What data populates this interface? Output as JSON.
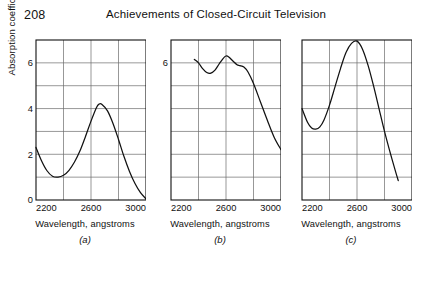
{
  "header": {
    "page_number": "208",
    "title": "Achievements of Closed-Circuit Television"
  },
  "figure": {
    "y_axis_title": "Absorption coefficient, relative units",
    "x_axis_title": "Wavelength, angstroms"
  },
  "chart_data": [
    {
      "type": "line",
      "panel_label": "(a)",
      "title": "",
      "xlabel": "Wavelength, angstroms",
      "ylabel": "Absorption coefficient, relative units",
      "xlim": [
        2200,
        3000
      ],
      "ylim": [
        0,
        7
      ],
      "xticks": [
        2200,
        2600,
        3000
      ],
      "xticklabels": [
        "2200",
        "2600",
        "3000"
      ],
      "yticks": [
        0,
        2,
        4,
        6
      ],
      "yticklabels": [
        "0",
        "2",
        "4",
        "6"
      ],
      "grid": true,
      "x_gridlines": [
        2200,
        2400,
        2600,
        2800,
        3000
      ],
      "y_gridlines": [
        0,
        1,
        2,
        3,
        4,
        5,
        6,
        7
      ],
      "x": [
        2200,
        2240,
        2280,
        2320,
        2360,
        2400,
        2440,
        2480,
        2520,
        2560,
        2600,
        2640,
        2660,
        2680,
        2720,
        2760,
        2800,
        2840,
        2880,
        2920,
        2960,
        3000
      ],
      "values": [
        2.3,
        1.72,
        1.28,
        1.04,
        1.0,
        1.08,
        1.3,
        1.66,
        2.15,
        2.78,
        3.45,
        4.05,
        4.2,
        4.18,
        3.9,
        3.35,
        2.65,
        1.9,
        1.25,
        0.72,
        0.32,
        0.05
      ]
    },
    {
      "type": "line",
      "panel_label": "(b)",
      "title": "",
      "xlabel": "Wavelength, angstroms",
      "ylabel": "Absorption coefficient, relative units",
      "xlim": [
        2200,
        3000
      ],
      "ylim": [
        0,
        7
      ],
      "xticks": [
        2200,
        2600,
        3000
      ],
      "xticklabels": [
        "2200",
        "2600",
        "3000"
      ],
      "yticks": [
        6
      ],
      "yticklabels": [
        "6"
      ],
      "grid": true,
      "x_gridlines": [
        2200,
        2400,
        2600,
        2800,
        3000
      ],
      "y_gridlines": [
        0,
        1,
        2,
        3,
        4,
        5,
        6,
        7
      ],
      "x": [
        2370,
        2400,
        2430,
        2460,
        2490,
        2520,
        2550,
        2580,
        2600,
        2620,
        2650,
        2680,
        2700,
        2730,
        2760,
        2800,
        2850,
        2900,
        2950,
        3000
      ],
      "values": [
        6.15,
        6.0,
        5.75,
        5.58,
        5.55,
        5.68,
        5.95,
        6.2,
        6.3,
        6.26,
        6.08,
        5.92,
        5.88,
        5.82,
        5.6,
        5.1,
        4.3,
        3.5,
        2.75,
        2.2
      ]
    },
    {
      "type": "line",
      "panel_label": "(c)",
      "title": "",
      "xlabel": "Wavelength, angstroms",
      "ylabel": "Absorption coefficient, relative units",
      "xlim": [
        2200,
        3000
      ],
      "ylim": [
        0,
        7
      ],
      "xticks": [
        2200,
        2600,
        3000
      ],
      "xticklabels": [
        "2200",
        "2600",
        "3000"
      ],
      "yticks": [],
      "yticklabels": [],
      "grid": true,
      "x_gridlines": [
        2200,
        2400,
        2600,
        2800,
        3000
      ],
      "y_gridlines": [
        0,
        1,
        2,
        3,
        4,
        5,
        6,
        7
      ],
      "x": [
        2200,
        2240,
        2270,
        2300,
        2330,
        2360,
        2400,
        2440,
        2480,
        2520,
        2560,
        2600,
        2640,
        2680,
        2720,
        2760,
        2800,
        2840,
        2880,
        2900
      ],
      "values": [
        4.0,
        3.4,
        3.15,
        3.1,
        3.2,
        3.5,
        4.15,
        4.95,
        5.75,
        6.45,
        6.85,
        6.95,
        6.6,
        5.9,
        5.0,
        4.0,
        3.0,
        2.1,
        1.25,
        0.85
      ]
    }
  ]
}
